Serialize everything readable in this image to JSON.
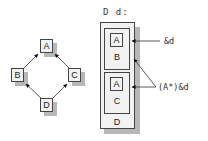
{
  "left_diagram": {
    "nodes": [
      {
        "id": "A",
        "label": "A"
      },
      {
        "id": "B",
        "label": "B"
      },
      {
        "id": "C",
        "label": "C"
      },
      {
        "id": "D",
        "label": "D"
      }
    ],
    "edges": [
      {
        "from": "B",
        "to": "A"
      },
      {
        "from": "C",
        "to": "A"
      },
      {
        "from": "D",
        "to": "B"
      },
      {
        "from": "D",
        "to": "C"
      }
    ]
  },
  "right_diagram": {
    "title": "D d:",
    "outer_label": "D",
    "subobject_1": {
      "inner_label": "A",
      "outer_label": "B"
    },
    "subobject_2": {
      "inner_label": "A",
      "outer_label": "C"
    },
    "annotations": {
      "ref_d": "&d",
      "cast_ref": "(A*)&d"
    }
  },
  "colors": {
    "box_fill": "#f2f2f2",
    "border": "#444444",
    "shadow": "#b8b8b8"
  }
}
